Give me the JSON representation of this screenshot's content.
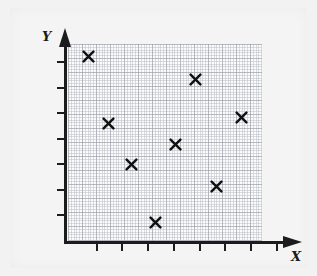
{
  "chart": {
    "title": "",
    "x_axis_label": "X",
    "y_axis_label": "Y",
    "marker_symbol": "x-cross",
    "background_color": "#f2f2f2",
    "grid_color": "#9b9ea8",
    "axis_color": "#1c1c1c",
    "marker_color": "#111111"
  },
  "chart_data": {
    "type": "scatter",
    "title": "",
    "xlabel": "X",
    "ylabel": "Y",
    "grid": true,
    "legend": null,
    "xlim": [
      0,
      8
    ],
    "ylim": [
      0,
      7
    ],
    "xticks": [
      1,
      2,
      3,
      4,
      5,
      6,
      7,
      8
    ],
    "yticks": [
      1,
      2,
      3,
      4,
      5,
      6,
      7
    ],
    "xticklabels": [
      "",
      "",
      "",
      "",
      "",
      "",
      "",
      ""
    ],
    "yticklabels": [
      "",
      "",
      "",
      "",
      "",
      "",
      ""
    ],
    "series": [
      {
        "name": "data",
        "marker": "x",
        "color": "#111111",
        "points": [
          {
            "x": 0.9,
            "y": 6.6
          },
          {
            "x": 1.7,
            "y": 4.2
          },
          {
            "x": 2.5,
            "y": 2.8
          },
          {
            "x": 3.4,
            "y": 0.7
          },
          {
            "x": 4.3,
            "y": 3.5
          },
          {
            "x": 5.1,
            "y": 5.8
          },
          {
            "x": 5.9,
            "y": 2.0
          },
          {
            "x": 6.9,
            "y": 4.5
          }
        ]
      }
    ]
  },
  "markers_px": [
    {
      "id": "point-1",
      "left": 82,
      "top": 50
    },
    {
      "id": "point-2",
      "left": 102,
      "top": 117
    },
    {
      "id": "point-3",
      "left": 125,
      "top": 158
    },
    {
      "id": "point-4",
      "left": 149,
      "top": 216
    },
    {
      "id": "point-5",
      "left": 169,
      "top": 138
    },
    {
      "id": "point-6",
      "left": 189,
      "top": 73
    },
    {
      "id": "point-7",
      "left": 210,
      "top": 180
    },
    {
      "id": "point-8",
      "left": 235,
      "top": 111
    }
  ],
  "ticks_px": {
    "x": [
      96,
      121,
      147,
      173,
      199,
      224,
      250,
      276
    ],
    "y": [
      61,
      87,
      112,
      138,
      163,
      189,
      214
    ]
  }
}
